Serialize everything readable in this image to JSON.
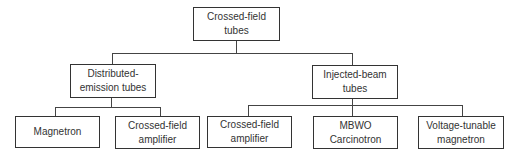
{
  "diagram": {
    "type": "tree",
    "colors": {
      "stroke": "#333333",
      "text": "#333333",
      "background": "#ffffff"
    },
    "root": {
      "label_lines": [
        "Crossed-field",
        "tubes"
      ]
    },
    "branches": [
      {
        "label_lines": [
          "Distributed-",
          "emission tubes"
        ],
        "children": [
          {
            "label_lines": [
              "Magnetron"
            ]
          },
          {
            "label_lines": [
              "Crossed-field",
              "amplifier"
            ]
          }
        ]
      },
      {
        "label_lines": [
          "Injected-beam",
          "tubes"
        ],
        "children": [
          {
            "label_lines": [
              "Crossed-field",
              "amplifier"
            ]
          },
          {
            "label_lines": [
              "MBWO",
              "Carcinotron"
            ]
          },
          {
            "label_lines": [
              "Voltage-tunable",
              "magnetron"
            ]
          }
        ]
      }
    ]
  }
}
